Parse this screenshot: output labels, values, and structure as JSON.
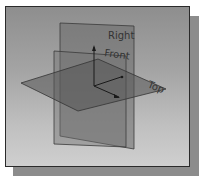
{
  "viewport": {
    "title": "Datum planes isometric view",
    "planes": [
      {
        "name": "Right",
        "label": "Right",
        "fill": "#6e6e6e"
      },
      {
        "name": "Front",
        "label": "Front",
        "fill": "#7a7a7a"
      },
      {
        "name": "Top",
        "label": "Top",
        "fill": "#5a5a5a"
      }
    ],
    "axes": {
      "x": "X",
      "y": "Y",
      "z": "Z"
    }
  },
  "colors": {
    "background_top": "#8e8e8e",
    "background_bottom": "#cfcfcf",
    "frame_border": "#2a2a2a",
    "shadow": "#8c8c8c"
  }
}
